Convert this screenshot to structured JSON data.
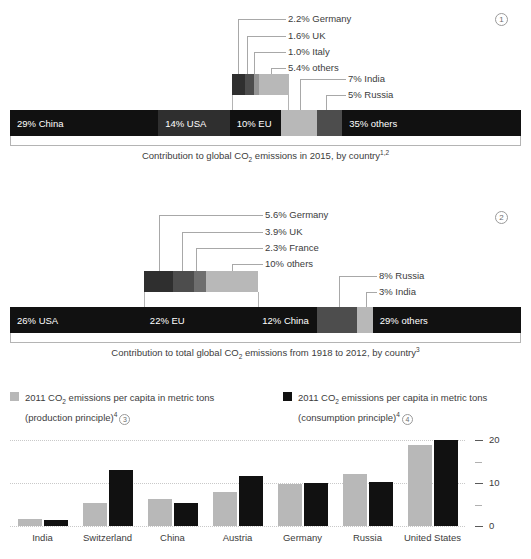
{
  "colors": {
    "black": "#111111",
    "dark": "#2f2f2f",
    "mid_dark": "#4d4d4d",
    "mid": "#6e6e6e",
    "mid_light": "#949494",
    "light": "#b8b8b8",
    "lighter": "#cfcfcf",
    "leader": "#a8a8a8",
    "text": "#3c3c3c",
    "grid": "#c9c9c9"
  },
  "panel1": {
    "index": "1",
    "caption_prefix": "Contribution to global CO",
    "caption_sub": "2",
    "caption_mid": " emissions in 2015, by country",
    "caption_sup": "1,2",
    "bar": [
      {
        "label": "29% China",
        "value": 29,
        "color": "#111111"
      },
      {
        "label": "14% USA",
        "value": 14,
        "color": "#2f2f2f"
      },
      {
        "label": "10% EU",
        "value": 10,
        "color": "#111111"
      },
      {
        "label": "",
        "value": 7,
        "color": "#b8b8b8",
        "callout": "7% India"
      },
      {
        "label": "",
        "value": 5,
        "color": "#4d4d4d",
        "callout": "5% Russia"
      },
      {
        "label": "35% others",
        "value": 35,
        "color": "#111111"
      }
    ],
    "breakout": {
      "of": "10% EU",
      "segments": [
        {
          "label": "2.2% Germany",
          "value": 2.2,
          "color": "#2f2f2f"
        },
        {
          "label": "1.6% UK",
          "value": 1.6,
          "color": "#4d4d4d"
        },
        {
          "label": "1.0% Italy",
          "value": 1.0,
          "color": "#949494"
        },
        {
          "label": "5.4% others",
          "value": 5.4,
          "color": "#b8b8b8"
        }
      ]
    },
    "side_callouts": [
      "7% India",
      "5% Russia"
    ]
  },
  "panel2": {
    "index": "2",
    "caption_prefix": "Contribution to total global CO",
    "caption_sub": "2",
    "caption_mid": " emissions from 1918 to 2012, by country",
    "caption_sup": "3",
    "bar": [
      {
        "label": "26% USA",
        "value": 26,
        "color": "#111111"
      },
      {
        "label": "22% EU",
        "value": 22,
        "color": "#111111"
      },
      {
        "label": "12% China",
        "value": 12,
        "color": "#111111"
      },
      {
        "label": "",
        "value": 8,
        "color": "#4d4d4d",
        "callout": "8% Russia"
      },
      {
        "label": "",
        "value": 3,
        "color": "#b8b8b8",
        "callout": "3% India"
      },
      {
        "label": "29% others",
        "value": 29,
        "color": "#111111"
      }
    ],
    "breakout": {
      "of": "22% EU",
      "segments": [
        {
          "label": "5.6% Germany",
          "value": 5.6,
          "color": "#2f2f2f"
        },
        {
          "label": "3.9% UK",
          "value": 3.9,
          "color": "#4d4d4d"
        },
        {
          "label": "2.3% France",
          "value": 2.3,
          "color": "#6e6e6e"
        },
        {
          "label": "10% others",
          "value": 10,
          "color": "#b8b8b8"
        }
      ]
    },
    "side_callouts": [
      "8% Russia",
      "3% India"
    ]
  },
  "legend": [
    {
      "color": "#b8b8b8",
      "line1_prefix": "2011 CO",
      "line1_sub": "2",
      "line1_rest": " emissions per capita in metric tons",
      "line2": "(production principle)",
      "line2_sup": "4",
      "index": "3"
    },
    {
      "color": "#111111",
      "line1_prefix": "2011 CO",
      "line1_sub": "2",
      "line1_rest": " emissions per capita in metric tons",
      "line2": "(consumption principle)",
      "line2_sup": "4",
      "index": "4"
    }
  ],
  "chart_data": {
    "type": "bar",
    "title": "",
    "xlabel": "",
    "ylabel": "",
    "ylim": [
      0,
      20
    ],
    "yticks": [
      0,
      5,
      10,
      15,
      20
    ],
    "ytick_labels": [
      "0",
      "",
      "10",
      "",
      "20"
    ],
    "gridlines": [
      0,
      10,
      20
    ],
    "grid": true,
    "legend_position": "above",
    "categories": [
      "India",
      "Switzerland",
      "China",
      "Austria",
      "Germany",
      "Russia",
      "United States"
    ],
    "series": [
      {
        "name": "2011 CO2 emissions per capita in metric tons (production principle)",
        "color": "#b8b8b8",
        "values": [
          1.7,
          5.3,
          6.2,
          8.0,
          9.7,
          12.1,
          18.8
        ]
      },
      {
        "name": "2011 CO2 emissions per capita in metric tons (consumption principle)",
        "color": "#111111",
        "values": [
          1.5,
          13.1,
          5.3,
          11.6,
          10.1,
          10.2,
          20.0
        ]
      }
    ]
  }
}
